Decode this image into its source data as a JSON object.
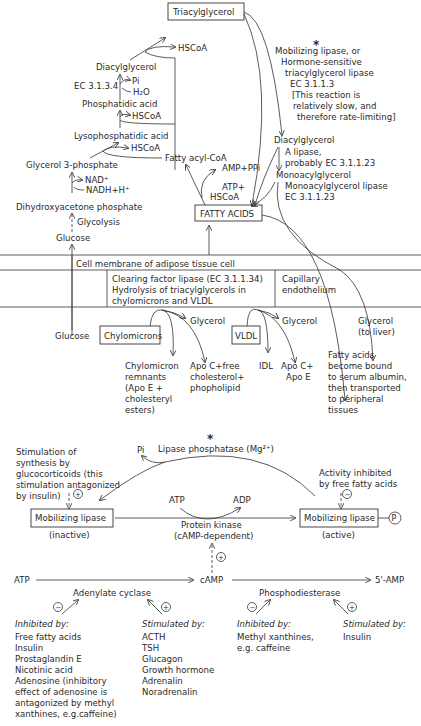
{
  "top": {
    "triacylglycerol": "Triacylglycerol",
    "hscoa1": "HSCoA",
    "diacylglycerol_left": "Diacylglycerol",
    "ec3134": "EC 3.1.3.4",
    "pi": "Pi",
    "h2o": "H₂O",
    "phosphatidic_acid": "Phosphatidic acid",
    "hscoa2": "HSCoA",
    "lysophosphatidic_acid": "Lysophosphatidic acid",
    "hscoa3": "HSCoA",
    "fatty_acyl_coa": "Fatty acyl-CoA",
    "amp_ppi": "AMP+PPi",
    "glycerol3p": "Glycerol 3-phosphate",
    "nad": "NAD⁺",
    "nadh": "NADH+H⁺",
    "atp": "ATP+",
    "hscoa4": "HSCoA",
    "dhap": "Dihydroxyacetone phosphate",
    "glycolysis": "Glycolysis",
    "glucose": "Glucose",
    "fatty_acids": "FATTY ACIDS",
    "star": "*",
    "mobilizing_lipase_lines": [
      "Mobilizing lipase, or",
      "Hormone-sensitive",
      "triacylglycerol lipase",
      "EC 3.1.1.3",
      "[This reaction is",
      "relatively slow, and",
      "therefore rate-limiting]"
    ],
    "diacylglycerol_right": "Diacylglycerol",
    "a_lipase_lines": [
      "A lipase,",
      "probably EC 3.1.1.23"
    ],
    "monoacylglycerol": "Monoacylglycerol",
    "mg_lipase_lines": [
      "Monoacylglycerol lipase",
      "EC 3.1.1.23"
    ]
  },
  "membrane": {
    "cell_membrane": "Cell membrane of adipose tissue cell",
    "clearing_lines": [
      "Clearing factor lipase (EC 3.1.1.34)",
      "Hydrolysis of triacylglycerols in",
      "chylomicrons and VLDL"
    ],
    "capillary_lines": [
      "Capillary",
      "endothelium"
    ]
  },
  "plasma": {
    "glucose": "Glucose",
    "chylomicrons": "Chylomicrons",
    "glycerol1": "Glycerol",
    "vldl": "VLDL",
    "glycerol2": "Glycerol",
    "glycerol_liver_lines": [
      "Glycerol",
      "(to liver)"
    ],
    "remnants_lines": [
      "Chylomicron",
      "remnants",
      "(Apo E +",
      "cholesteryl",
      "esters)"
    ],
    "apoc_lines": [
      "Apo C+free",
      "cholesterol+",
      "phopholipid"
    ],
    "idl": "IDL",
    "apoce_lines": [
      "Apo C+",
      "Apo E"
    ],
    "fa_albumin_lines": [
      "Fatty acids",
      "become bound",
      "to serum albumin,",
      "then transported",
      "to peripheral",
      "tissues"
    ]
  },
  "regulation": {
    "star": "*",
    "pi": "Pi",
    "lipase_phosphatase": "Lipase phosphatase (Mg²⁺)",
    "glucocorticoid_lines": [
      "Stimulation of",
      "synthesis by",
      "glucocorticoids (this",
      "stimulation antagonized",
      "by insulin)"
    ],
    "inhibited_ffa_lines": [
      "Activity inhibited",
      "by free fatty acids"
    ],
    "atp": "ATP",
    "adp": "ADP",
    "lipase_inactive": "Mobilizing lipase",
    "inactive": "(inactive)",
    "lipase_active": "Mobilizing lipase",
    "active": "(active)",
    "p": "P",
    "protein_kinase_lines": [
      "Protein kinase",
      "(cAMP-dependent)"
    ],
    "plus": "+",
    "minus": "−",
    "atp2": "ATP",
    "camp": "cAMP",
    "amp5": "5'-AMP",
    "adenylate_cyclase": "Adenylate cyclase",
    "phosphodiesterase": "Phosphodiesterase"
  },
  "effectors": [
    {
      "heading": "Inhibited by:",
      "items": [
        "Free fatty acids",
        "Insulin",
        "Prostaglandin E",
        "Nicotinic acid",
        "Adenosine (inhibitory",
        "effect of adenosine is",
        "antagonized by methyl",
        "xanthines, e.g.caffeine)"
      ]
    },
    {
      "heading": "Stimulated by:",
      "items": [
        "ACTH",
        "TSH",
        "Glucagon",
        "Growth hormone",
        "Adrenalin",
        "Noradrenalin"
      ]
    },
    {
      "heading": "Inhibited by:",
      "items": [
        "Methyl xanthines,",
        "e.g. caffeine"
      ]
    },
    {
      "heading": "Stimulated by:",
      "items": [
        "Insulin"
      ]
    }
  ]
}
